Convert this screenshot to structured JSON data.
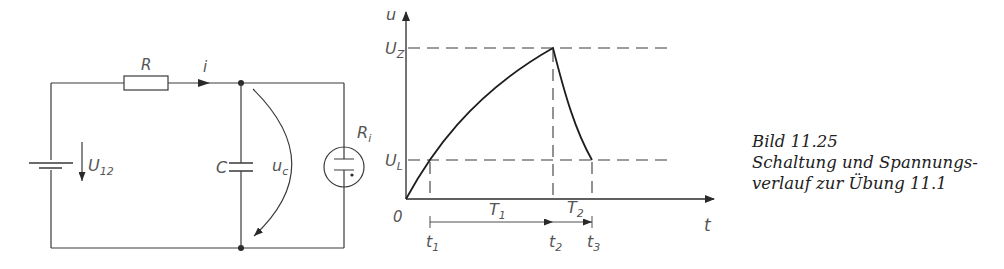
{
  "circuit": {
    "labels": {
      "resistor": "R",
      "current": "i",
      "source_voltage_main": "U",
      "source_voltage_sub": "12",
      "capacitor": "C",
      "cap_voltage_main": "u",
      "cap_voltage_sub": "c",
      "lamp_main": "R",
      "lamp_sub": "i"
    }
  },
  "graph": {
    "y_axis_label": "u",
    "x_axis_label": "t",
    "origin_label": "0",
    "levels": {
      "upper_main": "U",
      "upper_sub": "Z",
      "lower_main": "U",
      "lower_sub": "L"
    },
    "time_marks": [
      {
        "main": "t",
        "sub": "1"
      },
      {
        "main": "t",
        "sub": "2"
      },
      {
        "main": "t",
        "sub": "3"
      }
    ],
    "intervals": [
      {
        "main": "T",
        "sub": "1"
      },
      {
        "main": "T",
        "sub": "2"
      }
    ]
  },
  "caption": {
    "line1": "Bild 11.25",
    "line2": "Schaltung und Spannungs-",
    "line3": "verlauf zur Übung 11.1"
  },
  "colors": {
    "line": "#3a3a3a",
    "text": "#555555"
  }
}
